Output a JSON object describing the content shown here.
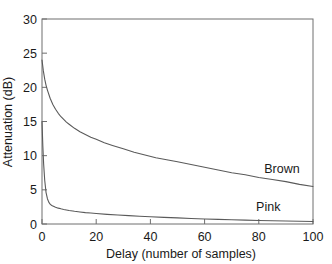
{
  "chart_data": {
    "type": "line",
    "title": "",
    "xlabel": "Delay (number of samples)",
    "ylabel": "Attenuation (dB)",
    "xlim": [
      0,
      100
    ],
    "ylim": [
      0,
      30
    ],
    "xticks": [
      0,
      20,
      40,
      60,
      80,
      100
    ],
    "yticks": [
      0,
      5,
      10,
      15,
      20,
      25,
      30
    ],
    "xtick_labels": [
      "0",
      "20",
      "40",
      "60",
      "80",
      "100"
    ],
    "ytick_labels": [
      "0",
      "5",
      "10",
      "15",
      "20",
      "25",
      "30"
    ],
    "grid": false,
    "legend_position": "inline-annotations",
    "line_color": "#5a5a5a",
    "axis_color": "#6e6e6e",
    "background": "#ffffff",
    "series": [
      {
        "name": "Brown",
        "label_text": "Brown",
        "x": [
          0,
          0.5,
          1,
          1.5,
          2,
          3,
          4,
          5,
          6,
          7,
          8,
          9,
          10,
          12,
          14,
          16,
          18,
          20,
          23,
          26,
          30,
          34,
          38,
          42,
          46,
          50,
          55,
          60,
          65,
          70,
          75,
          80,
          85,
          90,
          95,
          100
        ],
        "y": [
          24.0,
          22.4,
          21.2,
          20.3,
          19.6,
          18.4,
          17.5,
          16.8,
          16.2,
          15.7,
          15.3,
          14.9,
          14.6,
          14.0,
          13.5,
          13.1,
          12.7,
          12.4,
          11.9,
          11.5,
          11.0,
          10.5,
          10.1,
          9.7,
          9.4,
          9.1,
          8.7,
          8.3,
          7.9,
          7.5,
          7.2,
          6.8,
          6.5,
          6.2,
          5.8,
          5.5
        ]
      },
      {
        "name": "Pink",
        "label_text": "Pink",
        "x": [
          0,
          0.3,
          0.6,
          1,
          1.5,
          2,
          2.5,
          3,
          3.5,
          4,
          5,
          6,
          7,
          8,
          10,
          12,
          14,
          16,
          18,
          20,
          24,
          28,
          32,
          36,
          40,
          45,
          50,
          55,
          60,
          65,
          70,
          75,
          80,
          85,
          90,
          95,
          100
        ],
        "y": [
          15.0,
          11.5,
          8.8,
          6.4,
          4.6,
          3.7,
          3.2,
          2.9,
          2.75,
          2.62,
          2.45,
          2.32,
          2.22,
          2.13,
          1.98,
          1.86,
          1.76,
          1.67,
          1.6,
          1.53,
          1.41,
          1.31,
          1.22,
          1.14,
          1.06,
          0.97,
          0.89,
          0.81,
          0.74,
          0.68,
          0.62,
          0.57,
          0.52,
          0.48,
          0.44,
          0.4,
          0.36
        ]
      }
    ],
    "annotations": [
      {
        "text": "Brown",
        "x": 82,
        "y": 7.5
      },
      {
        "text": "Pink",
        "x": 79,
        "y": 1.9
      }
    ]
  }
}
